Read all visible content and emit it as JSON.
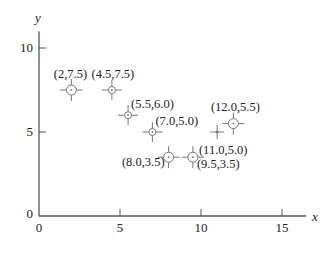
{
  "chart_data": {
    "type": "scatter",
    "title": "",
    "xlabel": "x",
    "ylabel": "y",
    "xlim": [
      0,
      16.5
    ],
    "ylim": [
      0,
      11
    ],
    "x_ticks": [
      0,
      5,
      10,
      15
    ],
    "y_ticks": [
      0,
      5,
      10
    ],
    "grid": false,
    "legend": null,
    "series": [
      {
        "name": "points",
        "points": [
          {
            "x": 2.0,
            "y": 7.5,
            "label": "(2,7.5)",
            "marker": "large",
            "label_pos": "above"
          },
          {
            "x": 4.5,
            "y": 7.5,
            "label": "(4.5,7.5)",
            "marker": "small",
            "label_pos": "above"
          },
          {
            "x": 5.5,
            "y": 6.0,
            "label": "(5.5,6.0)",
            "marker": "small",
            "label_pos": "above-right"
          },
          {
            "x": 7.0,
            "y": 5.0,
            "label": "(7.0,5.0)",
            "marker": "small",
            "label_pos": "above-right"
          },
          {
            "x": 8.0,
            "y": 3.5,
            "label": "(8.0,3.5)",
            "marker": "large",
            "label_pos": "below-left"
          },
          {
            "x": 9.5,
            "y": 3.5,
            "label": "(9.5,3.5)",
            "marker": "large",
            "label_pos": "below-right"
          },
          {
            "x": 11.0,
            "y": 5.0,
            "label": "(11.0,5.0)",
            "marker": "cross",
            "label_pos": "below"
          },
          {
            "x": 12.0,
            "y": 5.5,
            "label": "(12.0,5.5)",
            "marker": "large",
            "label_pos": "above"
          }
        ]
      }
    ]
  },
  "colors": {
    "axis": "#555555",
    "marker": "#777777",
    "text": "#222222"
  },
  "axes": {
    "x_label": "x",
    "y_label": "y",
    "x_tick_labels": [
      "0",
      "5",
      "10",
      "15"
    ],
    "y_tick_labels": [
      "0",
      "5",
      "10"
    ]
  }
}
